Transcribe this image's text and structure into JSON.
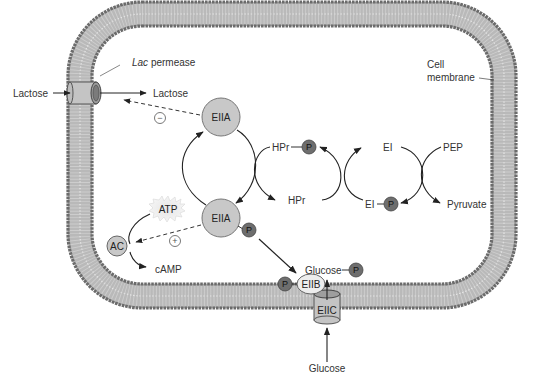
{
  "diagram": {
    "type": "biological-pathway",
    "colors": {
      "membrane_head": "#6b6b6b",
      "membrane_tail": "#9a9a9a",
      "protein_fill": "#c8c8c8",
      "phosphate_fill": "#6e6e6e",
      "line": "#222222"
    },
    "labels": {
      "lactose_out": "Lactose",
      "lactose_in": "Lactose",
      "lac_permease_italic": "Lac",
      "lac_permease_rest": " permease",
      "cell_membrane_line1": "Cell",
      "cell_membrane_line2": "membrane",
      "eiia_top": "EIIA",
      "eiia_bottom": "EIIA",
      "hpr_p": "HPr",
      "hpr": "HPr",
      "ei": "EI",
      "ei_p": "EI",
      "pep": "PEP",
      "pyruvate": "Pyruvate",
      "atp": "ATP",
      "ac": "AC",
      "camp": "cAMP",
      "glucose_p": "Glucose",
      "eiib": "EIIB",
      "eiic": "EIIC",
      "glucose_out": "Glucose",
      "phosphate": "P",
      "inhibit_sign": "−",
      "activate_sign": "+"
    },
    "nodes": [
      {
        "id": "lac-permease",
        "label": "Lac permease",
        "kind": "membrane-transporter"
      },
      {
        "id": "eiia-top",
        "label": "EIIA",
        "kind": "protein"
      },
      {
        "id": "eiia-p",
        "label": "EIIA-P",
        "kind": "protein-phosphorylated"
      },
      {
        "id": "hpr",
        "label": "HPr",
        "kind": "protein"
      },
      {
        "id": "hpr-p",
        "label": "HPr-P",
        "kind": "protein-phosphorylated"
      },
      {
        "id": "ei",
        "label": "EI",
        "kind": "protein"
      },
      {
        "id": "ei-p",
        "label": "EI-P",
        "kind": "protein-phosphorylated"
      },
      {
        "id": "pep",
        "label": "PEP",
        "kind": "metabolite"
      },
      {
        "id": "pyruvate",
        "label": "Pyruvate",
        "kind": "metabolite"
      },
      {
        "id": "ac",
        "label": "AC",
        "kind": "enzyme"
      },
      {
        "id": "atp",
        "label": "ATP",
        "kind": "metabolite"
      },
      {
        "id": "camp",
        "label": "cAMP",
        "kind": "metabolite"
      },
      {
        "id": "eiib",
        "label": "EIIB",
        "kind": "protein"
      },
      {
        "id": "eiic",
        "label": "EIIC",
        "kind": "membrane-transporter"
      },
      {
        "id": "glucose",
        "label": "Glucose",
        "kind": "metabolite"
      },
      {
        "id": "glucose-p",
        "label": "Glucose-P",
        "kind": "metabolite"
      }
    ],
    "edges": [
      {
        "from": "lactose_out",
        "to": "lactose_in",
        "via": "lac-permease",
        "style": "solid"
      },
      {
        "from": "eiia-top",
        "to": "lac-permease",
        "style": "dashed",
        "effect": "inhibit"
      },
      {
        "from": "eiia-p",
        "to": "ac",
        "style": "dashed",
        "effect": "activate"
      },
      {
        "from": "pep",
        "to": "pyruvate",
        "coupled": "ei -> ei-p"
      },
      {
        "from": "ei-p",
        "to": "ei",
        "coupled": "hpr -> hpr-p"
      },
      {
        "from": "hpr-p",
        "to": "hpr",
        "coupled": "eiia-top -> eiia-p"
      },
      {
        "from": "eiia-p",
        "to": "eiib",
        "style": "solid"
      },
      {
        "from": "glucose",
        "to": "glucose-p",
        "via": "eiic"
      },
      {
        "from": "atp",
        "to": "camp",
        "via": "ac"
      }
    ]
  }
}
